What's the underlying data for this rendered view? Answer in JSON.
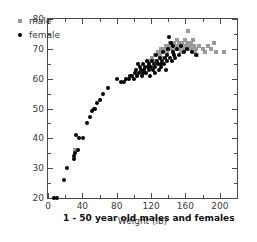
{
  "chart_data": {
    "type": "scatter",
    "title": "",
    "annotation": "1 - 50 year old males and females",
    "xlabel": "Weight (lb)",
    "ylabel": "Height (in.)",
    "xlim": [
      0,
      220
    ],
    "ylim": [
      20,
      80
    ],
    "xticks": [
      0,
      40,
      80,
      120,
      160,
      200
    ],
    "xticks_minor": [
      20,
      60,
      100,
      140,
      180,
      220
    ],
    "yticks": [
      20,
      30,
      40,
      50,
      60,
      70,
      80
    ],
    "yticks_minor": [
      25,
      35,
      45,
      55,
      65,
      75
    ],
    "grid": false,
    "legend_position": "upper-left-inside",
    "series": [
      {
        "name": "male",
        "marker": "square",
        "color": "#9a9a9a",
        "points": [
          [
            31,
            36
          ],
          [
            118,
            66
          ],
          [
            121,
            67
          ],
          [
            124,
            68
          ],
          [
            126,
            66
          ],
          [
            128,
            69
          ],
          [
            130,
            68
          ],
          [
            131,
            70
          ],
          [
            133,
            69
          ],
          [
            134,
            67
          ],
          [
            136,
            70
          ],
          [
            137,
            71
          ],
          [
            138,
            70
          ],
          [
            139,
            69
          ],
          [
            140,
            71
          ],
          [
            141,
            70
          ],
          [
            142,
            72
          ],
          [
            143,
            71
          ],
          [
            144,
            70
          ],
          [
            145,
            69
          ],
          [
            146,
            71
          ],
          [
            147,
            72
          ],
          [
            148,
            70
          ],
          [
            149,
            71
          ],
          [
            150,
            73
          ],
          [
            151,
            70
          ],
          [
            152,
            72
          ],
          [
            153,
            71
          ],
          [
            154,
            70
          ],
          [
            155,
            69
          ],
          [
            156,
            72
          ],
          [
            157,
            71
          ],
          [
            158,
            70
          ],
          [
            159,
            73
          ],
          [
            160,
            71
          ],
          [
            161,
            70
          ],
          [
            162,
            72
          ],
          [
            163,
            76
          ],
          [
            164,
            71
          ],
          [
            165,
            70
          ],
          [
            166,
            72
          ],
          [
            167,
            71
          ],
          [
            168,
            70
          ],
          [
            169,
            73
          ],
          [
            170,
            71
          ],
          [
            171,
            69
          ],
          [
            172,
            70
          ],
          [
            174,
            68
          ],
          [
            176,
            71
          ],
          [
            180,
            70
          ],
          [
            183,
            69
          ],
          [
            186,
            71
          ],
          [
            190,
            70
          ],
          [
            193,
            72
          ],
          [
            196,
            69
          ],
          [
            205,
            69
          ]
        ]
      },
      {
        "name": "female",
        "marker": "circle",
        "color": "#000000",
        "points": [
          [
            7,
            20
          ],
          [
            11,
            20
          ],
          [
            19,
            26
          ],
          [
            22,
            30
          ],
          [
            30,
            33
          ],
          [
            30,
            34
          ],
          [
            31,
            35
          ],
          [
            33,
            41
          ],
          [
            35,
            36
          ],
          [
            36,
            40
          ],
          [
            41,
            40
          ],
          [
            45,
            45
          ],
          [
            49,
            47
          ],
          [
            51,
            49
          ],
          [
            53,
            50
          ],
          [
            55,
            50
          ],
          [
            57,
            52
          ],
          [
            60,
            53
          ],
          [
            64,
            55
          ],
          [
            70,
            57
          ],
          [
            80,
            60
          ],
          [
            85,
            59
          ],
          [
            88,
            59
          ],
          [
            91,
            60
          ],
          [
            94,
            60
          ],
          [
            96,
            61
          ],
          [
            98,
            61
          ],
          [
            100,
            60
          ],
          [
            101,
            62
          ],
          [
            103,
            63
          ],
          [
            104,
            61
          ],
          [
            105,
            65
          ],
          [
            106,
            62
          ],
          [
            107,
            64
          ],
          [
            108,
            63
          ],
          [
            109,
            61
          ],
          [
            110,
            62
          ],
          [
            111,
            65
          ],
          [
            112,
            63
          ],
          [
            113,
            64
          ],
          [
            114,
            62
          ],
          [
            115,
            66
          ],
          [
            116,
            64
          ],
          [
            117,
            63
          ],
          [
            118,
            65
          ],
          [
            119,
            61
          ],
          [
            120,
            64
          ],
          [
            121,
            66
          ],
          [
            122,
            63
          ],
          [
            123,
            65
          ],
          [
            124,
            64
          ],
          [
            125,
            62
          ],
          [
            126,
            68
          ],
          [
            127,
            66
          ],
          [
            128,
            65
          ],
          [
            129,
            63
          ],
          [
            130,
            67
          ],
          [
            131,
            65
          ],
          [
            132,
            64
          ],
          [
            133,
            66
          ],
          [
            134,
            69
          ],
          [
            135,
            65
          ],
          [
            136,
            67
          ],
          [
            137,
            63
          ],
          [
            138,
            68
          ],
          [
            139,
            66
          ],
          [
            140,
            70
          ],
          [
            141,
            74
          ],
          [
            142,
            67
          ],
          [
            143,
            72
          ],
          [
            144,
            66
          ],
          [
            145,
            71
          ],
          [
            146,
            69
          ],
          [
            147,
            68
          ],
          [
            148,
            67
          ],
          [
            150,
            70
          ],
          [
            152,
            68
          ],
          [
            155,
            71
          ],
          [
            158,
            69
          ],
          [
            162,
            70
          ],
          [
            168,
            69
          ],
          [
            172,
            68
          ]
        ]
      }
    ]
  },
  "legend": {
    "items": [
      {
        "label": "male"
      },
      {
        "label": "female"
      }
    ]
  }
}
